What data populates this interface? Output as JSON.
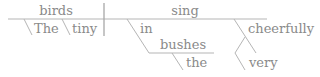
{
  "diagram": {
    "type": "sentence-diagram",
    "sentence": "The tiny birds sing cheerfully in the bushes",
    "subject": {
      "word": "birds",
      "modifiers": [
        "The",
        "tiny"
      ]
    },
    "predicate": {
      "word": "sing",
      "prepositional_phrase": {
        "preposition": "in",
        "object": "bushes",
        "object_modifier": "the"
      },
      "adverb": {
        "word": "cheerfully",
        "modifier": "very"
      }
    }
  }
}
